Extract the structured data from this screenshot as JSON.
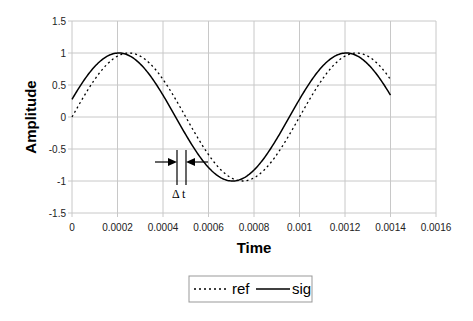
{
  "chart_data": {
    "type": "line",
    "title": "",
    "xlabel": "Time",
    "ylabel": "Amplitude",
    "xlim": [
      0,
      0.0016
    ],
    "ylim": [
      -1.5,
      1.5
    ],
    "x_ticks": [
      "0",
      "0.0002",
      "0.0004",
      "0.0006",
      "0.0008",
      "0.001",
      "0.0012",
      "0.0014",
      "0.0016"
    ],
    "y_ticks": [
      "1.5",
      "1",
      "0.5",
      "0",
      "-0.5",
      "-1",
      "-1.5"
    ],
    "grid": true,
    "legend_position": "bottom",
    "series": [
      {
        "name": "ref",
        "style": "dotted",
        "function": "sin(2*pi*1000*t)",
        "x_range": [
          0,
          0.0014
        ],
        "sample_points": [
          [
            0,
            0
          ],
          [
            0.00025,
            1
          ],
          [
            0.0005,
            0
          ],
          [
            0.00075,
            -1
          ],
          [
            0.001,
            0
          ],
          [
            0.00125,
            1
          ],
          [
            0.0014,
            0.59
          ]
        ]
      },
      {
        "name": "sig",
        "style": "solid",
        "function": "sin(2*pi*1000*t + 0.28)",
        "x_range": [
          0,
          0.0014
        ],
        "sample_points": [
          [
            0,
            0.28
          ],
          [
            0.000205,
            1
          ],
          [
            0.000455,
            0
          ],
          [
            0.000705,
            -1
          ],
          [
            0.000955,
            0
          ],
          [
            0.001205,
            1
          ],
          [
            0.0014,
            0.36
          ]
        ]
      }
    ],
    "annotations": [
      {
        "text": "Δ t",
        "x": 0.00048,
        "y": -1.22,
        "description": "time shift between zero crossings of sig and ref, marked by two vertical lines and inward arrows"
      }
    ]
  }
}
